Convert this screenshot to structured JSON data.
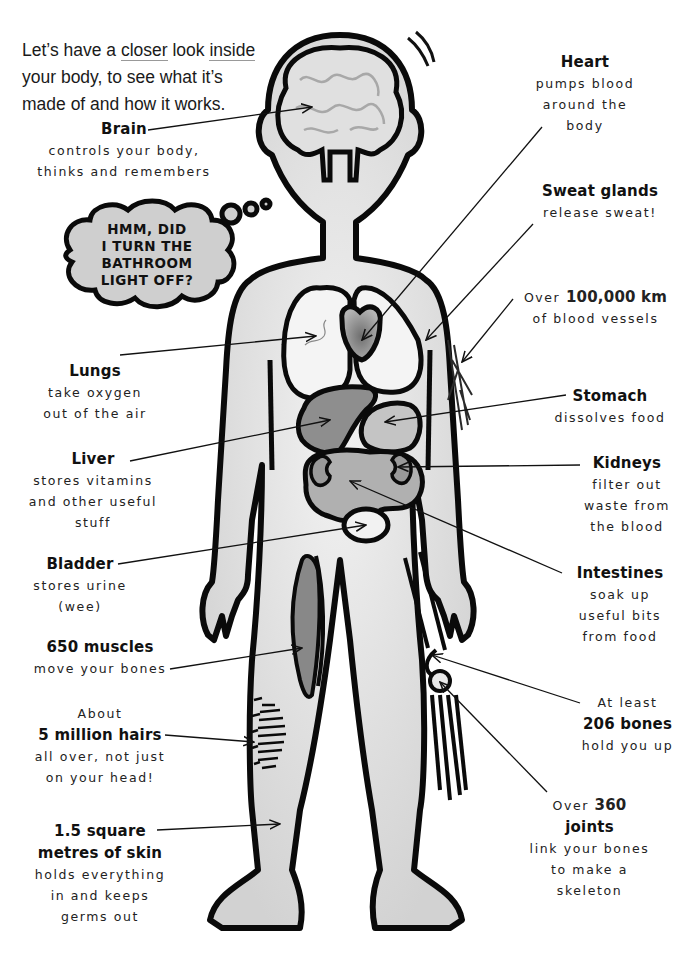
{
  "intro": {
    "line1_a": "Let’s have a ",
    "line1_u1": "closer",
    "line1_b": " look ",
    "line1_u2": "inside",
    "line2": "your body, to see what it’s",
    "line3": "made of and how it works."
  },
  "thought_bubble": {
    "lines": [
      "HMM, DID",
      "I TURN THE",
      "BATHROOM",
      "LIGHT OFF?"
    ]
  },
  "labels": {
    "brain": {
      "title": "Brain",
      "desc": [
        "controls your body,",
        "thinks and remembers"
      ]
    },
    "heart": {
      "title": "Heart",
      "desc": [
        "pumps blood",
        "around the",
        "body"
      ]
    },
    "sweat_glands": {
      "title": "Sweat glands",
      "desc": [
        "release sweat!"
      ]
    },
    "blood_vessels": {
      "prefix": "Over",
      "title": "100,000 km",
      "desc": [
        "of blood vessels"
      ]
    },
    "lungs": {
      "title": "Lungs",
      "desc": [
        "take oxygen",
        "out of the air"
      ]
    },
    "stomach": {
      "title": "Stomach",
      "desc": [
        "dissolves food"
      ]
    },
    "liver": {
      "title": "Liver",
      "desc": [
        "stores vitamins",
        "and other useful",
        "stuff"
      ]
    },
    "kidneys": {
      "title": "Kidneys",
      "desc": [
        "filter out",
        "waste from",
        "the blood"
      ]
    },
    "bladder": {
      "title": "Bladder",
      "desc": [
        "stores urine",
        "(wee)"
      ]
    },
    "intestines": {
      "title": "Intestines",
      "desc": [
        "soak up",
        "useful bits",
        "from food"
      ]
    },
    "muscles": {
      "title": "650 muscles",
      "desc": [
        "move your bones"
      ]
    },
    "bones": {
      "prefix": "At least",
      "title": "206 bones",
      "desc": [
        "hold you up"
      ]
    },
    "hairs": {
      "prefix": "About",
      "title": "5 million hairs",
      "desc": [
        "all over, not just",
        "on your head!"
      ]
    },
    "joints": {
      "prefix": "Over",
      "title_inline": "360",
      "title": "joints",
      "desc": [
        "link your bones",
        "to make a",
        "skeleton"
      ]
    },
    "skin": {
      "title": [
        "1.5 square",
        "metres of skin"
      ],
      "desc": [
        "holds everything",
        "in and keeps",
        "germs out"
      ]
    }
  },
  "colors": {
    "outline": "#0a0a0a",
    "body_fill": "#dedede",
    "organ_light": "#f4f4f4",
    "organ_mid": "#bdbdbd",
    "organ_dark": "#8f8f8f",
    "bubble_fill": "#cfcfcf"
  }
}
